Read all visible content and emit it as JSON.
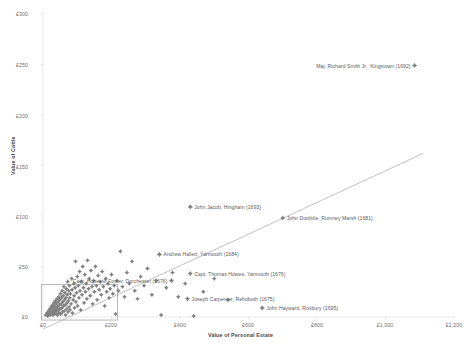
{
  "chart_data": {
    "type": "scatter",
    "title": "",
    "xlabel": "Value of Personal Estate",
    "ylabel": "Value of Cattle",
    "xlim": [
      0,
      1200
    ],
    "ylim": [
      0,
      300
    ],
    "grid": false,
    "legend": "none",
    "x_ticks": [
      "£0",
      "£200",
      "£400",
      "£600",
      "£800",
      "£1,000",
      "£1,200"
    ],
    "x_tick_values": [
      0,
      200,
      400,
      600,
      800,
      1000,
      1200
    ],
    "y_ticks": [
      "£0",
      "£50",
      "£100",
      "£150",
      "£200",
      "£250",
      "£300"
    ],
    "y_tick_values": [
      0,
      50,
      100,
      150,
      200,
      250,
      300
    ],
    "marker_shape": "diamond-star",
    "marker_color": "#808080",
    "trendline": {
      "visible": true,
      "color": "#a6a6a6",
      "x_start": 0,
      "y_start": -12,
      "x_end": 1110,
      "y_end": 162
    },
    "selection_box": {
      "visible": true,
      "color": "#9a9a9a",
      "x_min": -5,
      "x_max": 218,
      "y_min": -3,
      "y_max": 32
    },
    "annotations": [
      {
        "label": "Maj. Richard Smith Jr., Kingstown (1692)",
        "x": 1085,
        "y": 249,
        "anchor": "right"
      },
      {
        "label": "John Jacob, Hingham (1693)",
        "x": 430,
        "y": 109,
        "anchor": "left"
      },
      {
        "label": "John Doolittle, Rumney Marsh (1681)",
        "x": 700,
        "y": 98,
        "anchor": "left"
      },
      {
        "label": "Andrew Hallett, Yarmouth (1684)",
        "x": 340,
        "y": 62,
        "anchor": "left"
      },
      {
        "label": "Capt. Thomas Howes, Yarmouth (1676)",
        "x": 430,
        "y": 43,
        "anchor": "left"
      },
      {
        "label": "Capt. Hopestill Foster, Dorchester (1676)",
        "x": 375,
        "y": 36,
        "anchor": "right"
      },
      {
        "label": "Joseph Carpenter, Rehoboth (1675)",
        "x": 422,
        "y": 18,
        "anchor": "left"
      },
      {
        "label": "John Hayward, Roxbury (1695)",
        "x": 640,
        "y": 9,
        "anchor": "left"
      }
    ],
    "labeled_points": [
      {
        "x": 1085,
        "y": 249
      },
      {
        "x": 430,
        "y": 109
      },
      {
        "x": 700,
        "y": 98
      },
      {
        "x": 340,
        "y": 62
      },
      {
        "x": 430,
        "y": 43
      },
      {
        "x": 375,
        "y": 36
      },
      {
        "x": 422,
        "y": 18
      },
      {
        "x": 640,
        "y": 9
      }
    ],
    "points": [
      {
        "x": 8,
        "y": 2
      },
      {
        "x": 12,
        "y": 4
      },
      {
        "x": 14,
        "y": 1
      },
      {
        "x": 16,
        "y": 6
      },
      {
        "x": 18,
        "y": 3
      },
      {
        "x": 20,
        "y": 8
      },
      {
        "x": 21,
        "y": 2
      },
      {
        "x": 23,
        "y": 5
      },
      {
        "x": 24,
        "y": 10
      },
      {
        "x": 26,
        "y": 4
      },
      {
        "x": 27,
        "y": 7
      },
      {
        "x": 28,
        "y": 12
      },
      {
        "x": 29,
        "y": 2
      },
      {
        "x": 30,
        "y": 9
      },
      {
        "x": 31,
        "y": 5
      },
      {
        "x": 32,
        "y": 14
      },
      {
        "x": 33,
        "y": 3
      },
      {
        "x": 34,
        "y": 11
      },
      {
        "x": 35,
        "y": 7
      },
      {
        "x": 36,
        "y": 16
      },
      {
        "x": 37,
        "y": 4
      },
      {
        "x": 38,
        "y": 9
      },
      {
        "x": 39,
        "y": 13
      },
      {
        "x": 40,
        "y": 6
      },
      {
        "x": 41,
        "y": 18
      },
      {
        "x": 42,
        "y": 2
      },
      {
        "x": 43,
        "y": 10
      },
      {
        "x": 44,
        "y": 15
      },
      {
        "x": 45,
        "y": 7
      },
      {
        "x": 46,
        "y": 20
      },
      {
        "x": 47,
        "y": 4
      },
      {
        "x": 48,
        "y": 12
      },
      {
        "x": 49,
        "y": 17
      },
      {
        "x": 50,
        "y": 8
      },
      {
        "x": 51,
        "y": 23
      },
      {
        "x": 52,
        "y": 3
      },
      {
        "x": 53,
        "y": 13
      },
      {
        "x": 54,
        "y": 19
      },
      {
        "x": 55,
        "y": 9
      },
      {
        "x": 56,
        "y": 26
      },
      {
        "x": 57,
        "y": 5
      },
      {
        "x": 58,
        "y": 15
      },
      {
        "x": 59,
        "y": 21
      },
      {
        "x": 60,
        "y": 11
      },
      {
        "x": 61,
        "y": 30
      },
      {
        "x": 62,
        "y": 6
      },
      {
        "x": 63,
        "y": 17
      },
      {
        "x": 64,
        "y": 24
      },
      {
        "x": 65,
        "y": 12
      },
      {
        "x": 66,
        "y": 2
      },
      {
        "x": 67,
        "y": 19
      },
      {
        "x": 68,
        "y": 28
      },
      {
        "x": 69,
        "y": 8
      },
      {
        "x": 70,
        "y": 14
      },
      {
        "x": 71,
        "y": 22
      },
      {
        "x": 72,
        "y": 35
      },
      {
        "x": 73,
        "y": 5
      },
      {
        "x": 74,
        "y": 16
      },
      {
        "x": 75,
        "y": 26
      },
      {
        "x": 76,
        "y": 10
      },
      {
        "x": 77,
        "y": 31
      },
      {
        "x": 78,
        "y": 19
      },
      {
        "x": 79,
        "y": 7
      },
      {
        "x": 80,
        "y": 23
      },
      {
        "x": 82,
        "y": 13
      },
      {
        "x": 84,
        "y": 38
      },
      {
        "x": 85,
        "y": 27
      },
      {
        "x": 86,
        "y": 4
      },
      {
        "x": 88,
        "y": 17
      },
      {
        "x": 90,
        "y": 33
      },
      {
        "x": 91,
        "y": 21
      },
      {
        "x": 92,
        "y": 9
      },
      {
        "x": 94,
        "y": 29
      },
      {
        "x": 95,
        "y": 55
      },
      {
        "x": 96,
        "y": 15
      },
      {
        "x": 98,
        "y": 24
      },
      {
        "x": 100,
        "y": 40
      },
      {
        "x": 101,
        "y": 11
      },
      {
        "x": 103,
        "y": 31
      },
      {
        "x": 105,
        "y": 19
      },
      {
        "x": 107,
        "y": 45
      },
      {
        "x": 108,
        "y": 26
      },
      {
        "x": 110,
        "y": 7
      },
      {
        "x": 112,
        "y": 35
      },
      {
        "x": 114,
        "y": 22
      },
      {
        "x": 116,
        "y": 50
      },
      {
        "x": 118,
        "y": 29
      },
      {
        "x": 120,
        "y": 14
      },
      {
        "x": 122,
        "y": 42
      },
      {
        "x": 124,
        "y": 25
      },
      {
        "x": 126,
        "y": 33
      },
      {
        "x": 128,
        "y": 18
      },
      {
        "x": 130,
        "y": 56
      },
      {
        "x": 133,
        "y": 28
      },
      {
        "x": 135,
        "y": 38
      },
      {
        "x": 138,
        "y": 21
      },
      {
        "x": 140,
        "y": 46
      },
      {
        "x": 143,
        "y": 30
      },
      {
        "x": 145,
        "y": 13
      },
      {
        "x": 148,
        "y": 36
      },
      {
        "x": 150,
        "y": 25
      },
      {
        "x": 153,
        "y": 50
      },
      {
        "x": 156,
        "y": 31
      },
      {
        "x": 158,
        "y": 17
      },
      {
        "x": 161,
        "y": 41
      },
      {
        "x": 164,
        "y": 27
      },
      {
        "x": 167,
        "y": 35
      },
      {
        "x": 170,
        "y": 22
      },
      {
        "x": 173,
        "y": 45
      },
      {
        "x": 176,
        "y": 30
      },
      {
        "x": 180,
        "y": 11
      },
      {
        "x": 183,
        "y": 38
      },
      {
        "x": 186,
        "y": 25
      },
      {
        "x": 190,
        "y": 33
      },
      {
        "x": 193,
        "y": 19
      },
      {
        "x": 196,
        "y": 28
      },
      {
        "x": 200,
        "y": 42
      },
      {
        "x": 204,
        "y": 23
      },
      {
        "x": 208,
        "y": 31
      },
      {
        "x": 212,
        "y": 3
      },
      {
        "x": 216,
        "y": 36
      },
      {
        "x": 220,
        "y": 26
      },
      {
        "x": 226,
        "y": 65
      },
      {
        "x": 232,
        "y": 30
      },
      {
        "x": 238,
        "y": 20
      },
      {
        "x": 245,
        "y": 44
      },
      {
        "x": 252,
        "y": 33
      },
      {
        "x": 260,
        "y": 55
      },
      {
        "x": 268,
        "y": 26
      },
      {
        "x": 276,
        "y": 18
      },
      {
        "x": 285,
        "y": 40
      },
      {
        "x": 295,
        "y": 31
      },
      {
        "x": 305,
        "y": 48
      },
      {
        "x": 318,
        "y": 22
      },
      {
        "x": 330,
        "y": 36
      },
      {
        "x": 345,
        "y": 2
      },
      {
        "x": 360,
        "y": 29
      },
      {
        "x": 378,
        "y": 44
      },
      {
        "x": 395,
        "y": 20
      },
      {
        "x": 415,
        "y": 33
      },
      {
        "x": 440,
        "y": 1
      },
      {
        "x": 468,
        "y": 25
      },
      {
        "x": 500,
        "y": 38
      },
      {
        "x": 540,
        "y": 17
      }
    ]
  },
  "caption": {
    "text": " "
  }
}
